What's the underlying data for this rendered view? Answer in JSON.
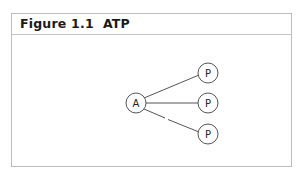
{
  "figure": {
    "title": "Figure 1.1  ATP"
  },
  "diagram": {
    "nodes": [
      {
        "id": "A",
        "label": "A",
        "cx": 136,
        "cy": 103
      },
      {
        "id": "P1",
        "label": "P",
        "cx": 208,
        "cy": 73
      },
      {
        "id": "P2",
        "label": "P",
        "cx": 208,
        "cy": 103
      },
      {
        "id": "P3",
        "label": "P",
        "cx": 208,
        "cy": 134
      }
    ],
    "edges": [
      {
        "from": "A",
        "to": "P1",
        "style": "solid"
      },
      {
        "from": "A",
        "to": "P2",
        "style": "solid"
      },
      {
        "from": "A",
        "to": "P3",
        "style": "broken"
      }
    ],
    "colors": {
      "stroke": "#555555",
      "frame": "#bdbdbd"
    }
  }
}
